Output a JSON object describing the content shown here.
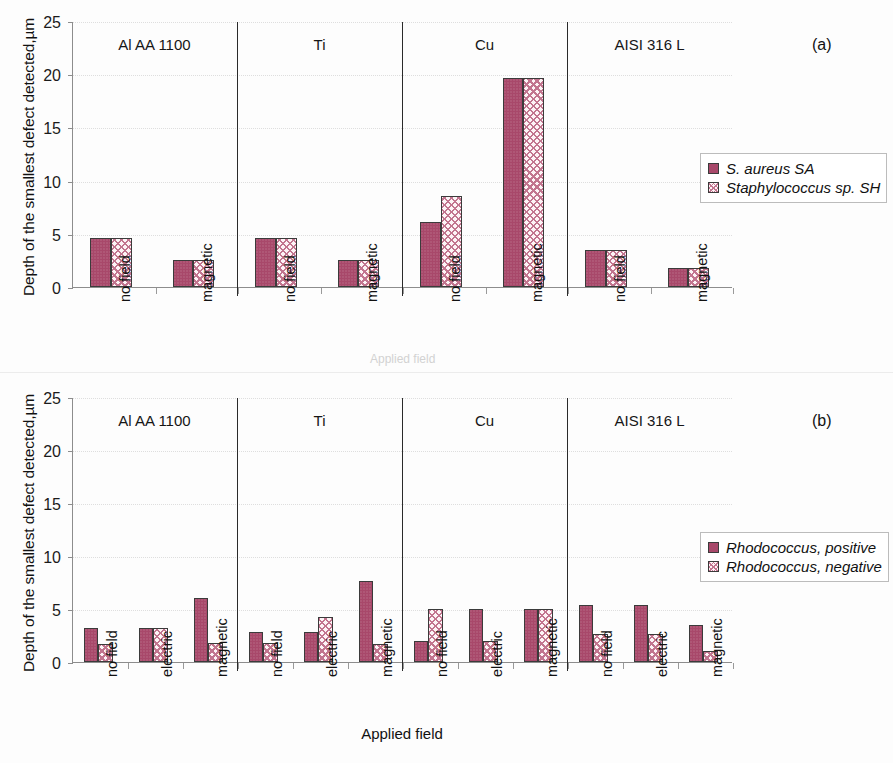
{
  "figure": {
    "ylabel": "Depth of the smallest defect detected,µm",
    "xlabel": "Applied field",
    "yticks": [
      "0",
      "5",
      "10",
      "15",
      "20",
      "25"
    ],
    "panel_a_letter": "(a)",
    "panel_b_letter": "(b)",
    "artifact_text": "Applied field",
    "colors": {
      "series1_fill": "#a8486a",
      "series2_fill": "#fdf4f6",
      "series2_hatch": "#c2758f",
      "bar_outline": "#3b3b3b",
      "axis": "#8d8d8d",
      "separator": "#2a2a2a"
    }
  },
  "chart_data": [
    {
      "type": "bar",
      "title": "(a)",
      "xlabel": "Applied field",
      "ylabel": "Depth of the smallest defect detected,µm",
      "ylim": [
        0,
        25
      ],
      "yticks": [
        0,
        5,
        10,
        15,
        20,
        25
      ],
      "grid": false,
      "legend_position": "right",
      "groups": [
        "Al AA 1100",
        "Ti",
        "Cu",
        "AISI 316 L"
      ],
      "categories": [
        "no field",
        "magnetic"
      ],
      "series": [
        {
          "name": "S. aureus SA",
          "values": [
            4.6,
            2.55,
            4.6,
            2.5,
            6.1,
            19.6,
            3.5,
            1.8
          ]
        },
        {
          "name": "Staphylococcus sp. SH",
          "values": [
            4.6,
            2.55,
            4.6,
            2.5,
            8.6,
            19.6,
            3.5,
            1.8
          ]
        }
      ],
      "points": [
        {
          "group": "Al AA 1100",
          "category": "no field",
          "S. aureus SA": 4.6,
          "Staphylococcus sp. SH": 4.6
        },
        {
          "group": "Al AA 1100",
          "category": "magnetic",
          "S. aureus SA": 2.55,
          "Staphylococcus sp. SH": 2.55
        },
        {
          "group": "Ti",
          "category": "no field",
          "S. aureus SA": 4.6,
          "Staphylococcus sp. SH": 4.6
        },
        {
          "group": "Ti",
          "category": "magnetic",
          "S. aureus SA": 2.5,
          "Staphylococcus sp. SH": 2.5
        },
        {
          "group": "Cu",
          "category": "no field",
          "S. aureus SA": 6.1,
          "Staphylococcus sp. SH": 8.6
        },
        {
          "group": "Cu",
          "category": "magnetic",
          "S. aureus SA": 19.6,
          "Staphylococcus sp. SH": 19.6
        },
        {
          "group": "AISI 316 L",
          "category": "no field",
          "S. aureus SA": 3.5,
          "Staphylococcus sp. SH": 3.5
        },
        {
          "group": "AISI 316 L",
          "category": "magnetic",
          "S. aureus SA": 1.8,
          "Staphylococcus sp. SH": 1.8
        }
      ]
    },
    {
      "type": "bar",
      "title": "(b)",
      "xlabel": "Applied field",
      "ylabel": "Depth of the smallest defect detected,µm",
      "ylim": [
        0,
        25
      ],
      "yticks": [
        0,
        5,
        10,
        15,
        20,
        25
      ],
      "grid": false,
      "legend_position": "right",
      "groups": [
        "Al AA 1100",
        "Ti",
        "Cu",
        "AISI 316 L"
      ],
      "categories": [
        "no field",
        "electric",
        "magnetic"
      ],
      "series": [
        {
          "name": "Rhodococcus, positive",
          "values": [
            3.2,
            3.2,
            6.0,
            2.8,
            2.8,
            7.6,
            2.0,
            5.0,
            5.0,
            5.4,
            5.4,
            3.5
          ]
        },
        {
          "name": "Rhodococcus, negative",
          "values": [
            1.7,
            3.2,
            1.8,
            1.8,
            4.2,
            1.7,
            5.0,
            2.0,
            5.0,
            2.6,
            2.6,
            1.0
          ]
        }
      ],
      "points": [
        {
          "group": "Al AA 1100",
          "category": "no field",
          "Rhodococcus, positive": 3.2,
          "Rhodococcus, negative": 1.7
        },
        {
          "group": "Al AA 1100",
          "category": "electric",
          "Rhodococcus, positive": 3.2,
          "Rhodococcus, negative": 3.2
        },
        {
          "group": "Al AA 1100",
          "category": "magnetic",
          "Rhodococcus, positive": 6.0,
          "Rhodococcus, negative": 1.8
        },
        {
          "group": "Ti",
          "category": "no field",
          "Rhodococcus, positive": 2.8,
          "Rhodococcus, negative": 1.8
        },
        {
          "group": "Ti",
          "category": "electric",
          "Rhodococcus, positive": 2.8,
          "Rhodococcus, negative": 4.2
        },
        {
          "group": "Ti",
          "category": "magnetic",
          "Rhodococcus, positive": 7.6,
          "Rhodococcus, negative": 1.7
        },
        {
          "group": "Cu",
          "category": "no field",
          "Rhodococcus, positive": 2.0,
          "Rhodococcus, negative": 5.0
        },
        {
          "group": "Cu",
          "category": "electric",
          "Rhodococcus, positive": 5.0,
          "Rhodococcus, negative": 2.0
        },
        {
          "group": "Cu",
          "category": "magnetic",
          "Rhodococcus, positive": 5.0,
          "Rhodococcus, negative": 5.0
        },
        {
          "group": "AISI 316 L",
          "category": "no field",
          "Rhodococcus, positive": 5.4,
          "Rhodococcus, negative": 2.6
        },
        {
          "group": "AISI 316 L",
          "category": "electric",
          "Rhodococcus, positive": 5.4,
          "Rhodococcus, negative": 2.6
        },
        {
          "group": "AISI 316 L",
          "category": "magnetic",
          "Rhodococcus, positive": 3.5,
          "Rhodococcus, negative": 1.0
        }
      ]
    }
  ]
}
